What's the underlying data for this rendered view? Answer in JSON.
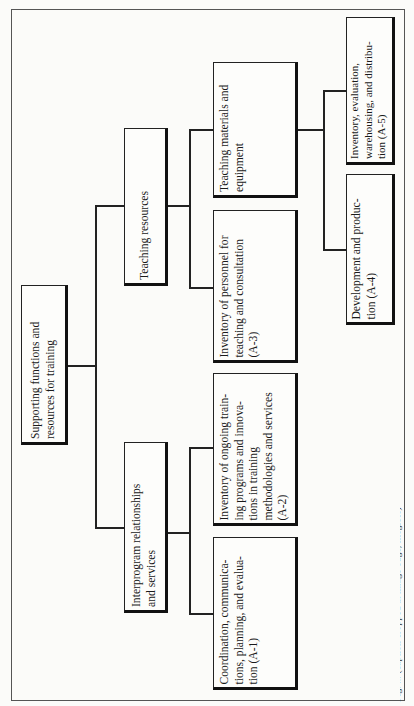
{
  "diagram": {
    "orientation": "rotated-90-ccw",
    "root": {
      "label": "Supporting functions and\nresources for training"
    },
    "branches": [
      {
        "label": "Interprogram relationships\nand services",
        "children": [
          {
            "label": "Coordination, communica-\ntions, planning, and evalua-\ntion (A-1)"
          },
          {
            "label": "Inventory of ongoing train-\ning programs and innova-\ntions in training\nmethodologies and services\n(A-2)"
          }
        ]
      },
      {
        "label": "Teaching resources",
        "children": [
          {
            "label": "Inventory of personnel for\nteaching and consultation\n(A-3)"
          },
          {
            "label": "Teaching materials and\nequipment",
            "children": [
              {
                "label": "Development and produc-\ntion (A-4)"
              },
              {
                "label": "Inventory, evaluation,\nwarehousing, and distribu-\ntion (A-5)"
              }
            ]
          }
        ]
      }
    ],
    "caption": "Fig. ... (caption cropped at image edge, illegible)"
  }
}
